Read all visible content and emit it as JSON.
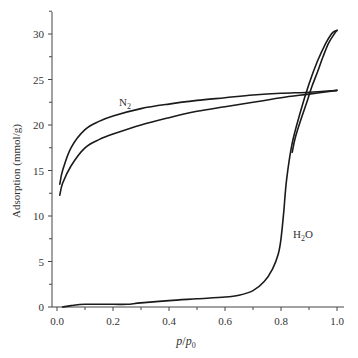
{
  "chart_data": {
    "type": "line",
    "title": "",
    "xlabel": "p/p0",
    "ylabel": "Adsorption (mmol/g)",
    "xlim": [
      0.0,
      1.0
    ],
    "ylim": [
      0,
      32
    ],
    "grid": false,
    "legend": "none (inline curve labels)",
    "x_ticks": [
      "0.0",
      "0.2",
      "0.4",
      "0.6",
      "0.8",
      "1.0"
    ],
    "y_ticks": [
      "0",
      "5",
      "10",
      "15",
      "20",
      "25",
      "30"
    ],
    "annotations": [
      {
        "text": "N2",
        "x": 0.22,
        "y": 24.0
      },
      {
        "text": "H2O",
        "x": 0.86,
        "y": 7.0
      }
    ],
    "series": [
      {
        "name": "N2 desorption (upper)",
        "x": [
          0.01,
          0.02,
          0.05,
          0.1,
          0.15,
          0.2,
          0.3,
          0.4,
          0.5,
          0.6,
          0.7,
          0.8,
          0.9,
          1.0
        ],
        "y": [
          13.5,
          15.0,
          17.5,
          19.5,
          20.4,
          21.0,
          21.8,
          22.3,
          22.7,
          23.0,
          23.3,
          23.5,
          23.6,
          23.8
        ]
      },
      {
        "name": "N2 adsorption (lower)",
        "x": [
          0.01,
          0.02,
          0.05,
          0.1,
          0.15,
          0.2,
          0.3,
          0.4,
          0.5,
          0.6,
          0.7,
          0.8,
          0.9,
          1.0
        ],
        "y": [
          12.3,
          13.6,
          15.5,
          17.5,
          18.4,
          19.0,
          20.0,
          20.8,
          21.5,
          22.0,
          22.5,
          23.0,
          23.4,
          23.8
        ]
      },
      {
        "name": "H2O adsorption",
        "x": [
          0.02,
          0.05,
          0.1,
          0.2,
          0.25,
          0.3,
          0.4,
          0.5,
          0.6,
          0.65,
          0.7,
          0.74,
          0.77,
          0.79,
          0.8,
          0.81,
          0.82,
          0.84,
          0.87,
          0.9,
          0.93,
          0.96,
          0.98,
          0.99,
          1.0
        ],
        "y": [
          0,
          0.15,
          0.3,
          0.3,
          0.3,
          0.45,
          0.7,
          0.9,
          1.1,
          1.3,
          1.8,
          2.8,
          4.2,
          5.8,
          7.5,
          10.5,
          14.0,
          18.0,
          21.5,
          24.5,
          27.0,
          29.0,
          30.0,
          30.3,
          30.4
        ]
      },
      {
        "name": "H2O desorption",
        "x": [
          1.0,
          0.99,
          0.97,
          0.95,
          0.93,
          0.91,
          0.89,
          0.87,
          0.85,
          0.84
        ],
        "y": [
          30.4,
          30.0,
          29.0,
          27.5,
          25.8,
          24.2,
          22.3,
          20.5,
          18.5,
          17.0
        ]
      }
    ]
  },
  "labels": {
    "n2": "N",
    "n2_sub": "2",
    "h2o_h": "H",
    "h2o_sub": "2",
    "h2o_o": "O",
    "ylabel": "Adsorption (mmol/g)",
    "xlabel_p": "p",
    "xlabel_slash": "/",
    "xlabel_p0": "p",
    "xlabel_sub": "0"
  }
}
